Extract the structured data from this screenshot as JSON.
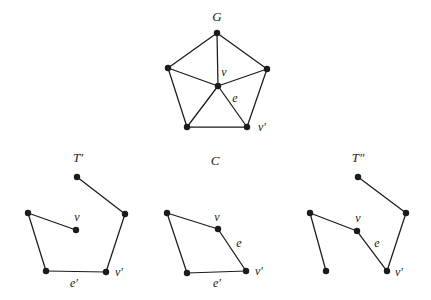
{
  "page": {
    "background": "#ffffff"
  },
  "figure": {
    "ink": "#1b1b1b",
    "vertex_radius": 3.2,
    "edge_width": 1.25,
    "width": 431,
    "height": 300,
    "graphs": [
      {
        "id": "G",
        "title": "G",
        "title_pos": {
          "x": 217,
          "y": 21
        },
        "vertices": [
          {
            "id": "top",
            "x": 217,
            "y": 33
          },
          {
            "id": "left",
            "x": 168,
            "y": 68
          },
          {
            "id": "right",
            "x": 267,
            "y": 69
          },
          {
            "id": "v",
            "x": 218,
            "y": 86
          },
          {
            "id": "bl",
            "x": 187,
            "y": 127
          },
          {
            "id": "vp",
            "x": 247,
            "y": 127
          }
        ],
        "edges": [
          [
            "top",
            "left"
          ],
          [
            "top",
            "right"
          ],
          [
            "left",
            "bl"
          ],
          [
            "right",
            "vp"
          ],
          [
            "bl",
            "vp"
          ],
          [
            "v",
            "top"
          ],
          [
            "v",
            "left"
          ],
          [
            "v",
            "right"
          ],
          [
            "v",
            "bl"
          ],
          [
            "v",
            "vp"
          ]
        ],
        "labels": [
          {
            "text": "v",
            "x": 224,
            "y": 76
          },
          {
            "text": "e",
            "x": 235,
            "y": 102
          },
          {
            "text": "v′",
            "x": 262,
            "y": 131
          }
        ]
      },
      {
        "id": "T-prime",
        "title": "T′",
        "title_pos": {
          "x": 78,
          "y": 162
        },
        "vertices": [
          {
            "id": "top",
            "x": 77,
            "y": 177
          },
          {
            "id": "left",
            "x": 28,
            "y": 213
          },
          {
            "id": "right",
            "x": 125,
            "y": 214
          },
          {
            "id": "v",
            "x": 76,
            "y": 230
          },
          {
            "id": "bl",
            "x": 46,
            "y": 271
          },
          {
            "id": "vp",
            "x": 106,
            "y": 272
          }
        ],
        "edges": [
          [
            "top",
            "right"
          ],
          [
            "right",
            "vp"
          ],
          [
            "vp",
            "bl"
          ],
          [
            "bl",
            "left"
          ],
          [
            "left",
            "v"
          ]
        ],
        "labels": [
          {
            "text": "v",
            "x": 77,
            "y": 221
          },
          {
            "text": "e′",
            "x": 74,
            "y": 287
          },
          {
            "text": "v′",
            "x": 119,
            "y": 276
          }
        ]
      },
      {
        "id": "C",
        "title": "C",
        "title_pos": {
          "x": 215,
          "y": 165
        },
        "vertices": [
          {
            "id": "left",
            "x": 167,
            "y": 213
          },
          {
            "id": "v",
            "x": 218,
            "y": 229
          },
          {
            "id": "bl",
            "x": 187,
            "y": 273
          },
          {
            "id": "vp",
            "x": 246,
            "y": 271
          }
        ],
        "edges": [
          [
            "left",
            "v"
          ],
          [
            "v",
            "vp"
          ],
          [
            "vp",
            "bl"
          ],
          [
            "bl",
            "left"
          ]
        ],
        "labels": [
          {
            "text": "v",
            "x": 217,
            "y": 221
          },
          {
            "text": "e",
            "x": 239,
            "y": 247
          },
          {
            "text": "e′",
            "x": 217,
            "y": 287
          },
          {
            "text": "v′",
            "x": 259,
            "y": 275
          }
        ]
      },
      {
        "id": "T-doubleprime",
        "title": "T″",
        "title_pos": {
          "x": 358,
          "y": 162
        },
        "vertices": [
          {
            "id": "top",
            "x": 358,
            "y": 177
          },
          {
            "id": "left",
            "x": 310,
            "y": 213
          },
          {
            "id": "right",
            "x": 406,
            "y": 213
          },
          {
            "id": "v",
            "x": 357,
            "y": 231
          },
          {
            "id": "bl",
            "x": 326,
            "y": 271
          },
          {
            "id": "vp",
            "x": 387,
            "y": 271
          }
        ],
        "edges": [
          [
            "top",
            "right"
          ],
          [
            "right",
            "vp"
          ],
          [
            "vp",
            "v"
          ],
          [
            "v",
            "left"
          ],
          [
            "left",
            "bl"
          ]
        ],
        "labels": [
          {
            "text": "v",
            "x": 358,
            "y": 222
          },
          {
            "text": "e",
            "x": 377,
            "y": 247
          },
          {
            "text": "v′",
            "x": 399,
            "y": 276
          }
        ]
      }
    ]
  }
}
